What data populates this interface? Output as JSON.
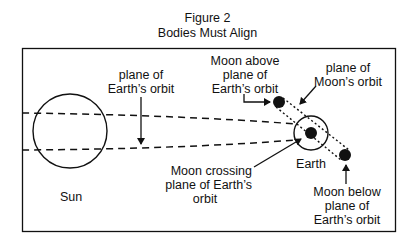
{
  "figure": {
    "number_label": "Figure 2",
    "title": "Bodies Must Align"
  },
  "labels": {
    "plane_earth_orbit": [
      "plane of",
      "Earth’s orbit"
    ],
    "moon_above": [
      "Moon above",
      "plane of",
      "Earth’s orbit"
    ],
    "plane_moon_orbit": [
      "plane of",
      "Moon’s orbit"
    ],
    "sun": "Sun",
    "earth": "Earth",
    "moon_crossing": [
      "Moon crossing",
      "plane of Earth’s",
      "orbit"
    ],
    "moon_below": [
      "Moon below",
      "plane of",
      "Earth’s orbit"
    ]
  },
  "colors": {
    "line": "#111111",
    "background": "#ffffff"
  }
}
